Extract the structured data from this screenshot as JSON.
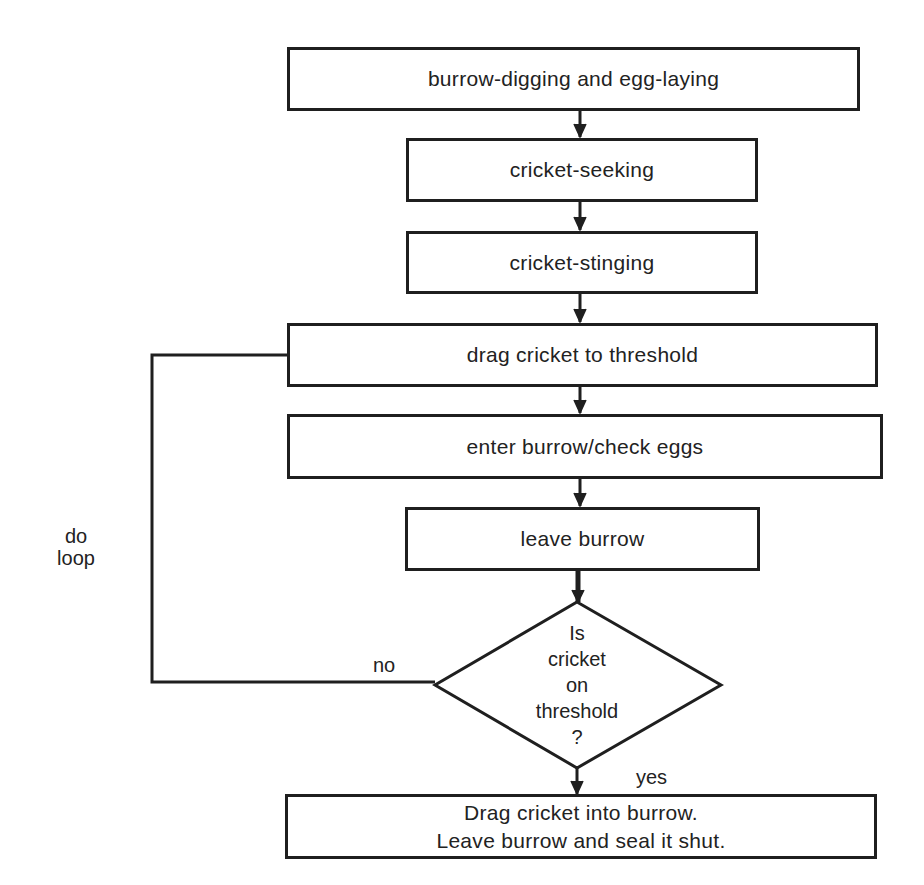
{
  "diagram": {
    "type": "flowchart",
    "colors": {
      "stroke": "#1f1f1f",
      "text": "#222222",
      "background": "#ffffff"
    },
    "nodes": [
      {
        "id": "burrow-digging",
        "shape": "rect",
        "label": "burrow-digging and egg-laying"
      },
      {
        "id": "cricket-seeking",
        "shape": "rect",
        "label": "cricket-seeking"
      },
      {
        "id": "cricket-stinging",
        "shape": "rect",
        "label": "cricket-stinging"
      },
      {
        "id": "drag-to-threshold",
        "shape": "rect",
        "label": "drag cricket to threshold"
      },
      {
        "id": "enter-burrow",
        "shape": "rect",
        "label": "enter burrow/check eggs"
      },
      {
        "id": "leave-burrow",
        "shape": "rect",
        "label": "leave burrow"
      },
      {
        "id": "decision",
        "shape": "diamond",
        "lines": [
          "Is",
          "cricket",
          "on",
          "threshold",
          "?"
        ]
      },
      {
        "id": "final",
        "shape": "rect",
        "lines": [
          "Drag cricket into burrow.",
          "Leave burrow and seal it shut."
        ]
      }
    ],
    "edges": [
      {
        "from": "burrow-digging",
        "to": "cricket-seeking"
      },
      {
        "from": "cricket-seeking",
        "to": "cricket-stinging"
      },
      {
        "from": "cricket-stinging",
        "to": "drag-to-threshold"
      },
      {
        "from": "drag-to-threshold",
        "to": "enter-burrow"
      },
      {
        "from": "enter-burrow",
        "to": "leave-burrow"
      },
      {
        "from": "leave-burrow",
        "to": "decision"
      },
      {
        "from": "decision",
        "to": "drag-to-threshold",
        "label": "no"
      },
      {
        "from": "decision",
        "to": "final",
        "label": "yes"
      }
    ],
    "labels": {
      "no": "no",
      "yes": "yes",
      "loop_line1": "do",
      "loop_line2": "loop"
    }
  }
}
